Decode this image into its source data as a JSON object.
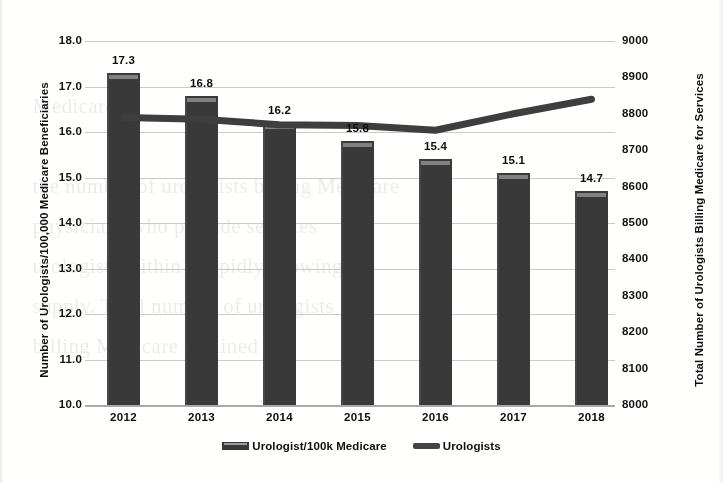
{
  "chart_data": {
    "type": "bar",
    "title": "",
    "subtitle": "",
    "categories": [
      "2012",
      "2013",
      "2014",
      "2015",
      "2016",
      "2017",
      "2018"
    ],
    "xlabel": "",
    "series": [
      {
        "name": "Urologist/100k Medicare",
        "type": "bar",
        "axis": "left",
        "values": [
          17.3,
          16.8,
          16.2,
          15.8,
          15.4,
          15.1,
          14.7
        ],
        "data_labels": [
          "17.3",
          "16.8",
          "16.2",
          "15.8",
          "15.4",
          "15.1",
          "14.7"
        ],
        "color": "#3a3a3a"
      },
      {
        "name": "Urologists",
        "type": "line",
        "axis": "right",
        "values": [
          8790,
          8785,
          8770,
          8768,
          8755,
          8800,
          8840
        ],
        "color": "#3f3f3f"
      }
    ],
    "left_axis": {
      "label": "Number of Urologists/100,000 Medicare Beneficiaries",
      "ylim": [
        10.0,
        18.0
      ],
      "ticks": [
        "18.0",
        "17.0",
        "16.0",
        "15.0",
        "14.0",
        "13.0",
        "12.0",
        "11.0",
        "10.0"
      ]
    },
    "right_axis": {
      "label": "Total Number of Urologists Billing Medicare for Services",
      "ylim": [
        8000,
        9000
      ],
      "ticks": [
        "9000",
        "8900",
        "8800",
        "8700",
        "8600",
        "8500",
        "8400",
        "8300",
        "8200",
        "8100",
        "8000"
      ]
    },
    "grid": true,
    "legend": {
      "position": "bottom",
      "entries": [
        "Urologist/100k Medicare",
        "Urologists"
      ]
    }
  },
  "legend": {
    "items": [
      {
        "label": "Urologist/100k Medicare",
        "marker": "bar-swatch-icon"
      },
      {
        "label": "Urologists",
        "marker": "line-swatch-icon"
      }
    ]
  },
  "background_text": {
    "lines": [
      "                                                                   ",
      "                                                                   ",
      "    Medicare                                                       ",
      "                                                                   ",
      "    the number of urologists billing Medicare                      ",
      "    physicians who provide services                                ",
      "    urologists within a rapidly growing                            ",
      "    supply. Total number of urologists                             ",
      "    billing Medicare declined                                      "
    ]
  }
}
